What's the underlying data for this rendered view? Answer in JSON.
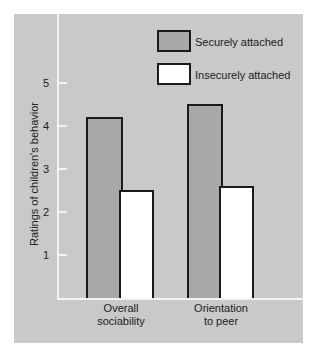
{
  "chart_data": {
    "type": "bar",
    "title": "",
    "xlabel": "",
    "ylabel": "Ratings of children's behavior",
    "ylim": [
      0,
      5.5
    ],
    "yticks": [
      1,
      2,
      3,
      4,
      5
    ],
    "grid": false,
    "legend_position": "top-right",
    "categories": [
      "Overall sociability",
      "Orientation to peer"
    ],
    "category_lines": [
      [
        "Overall",
        "sociability"
      ],
      [
        "Orientation",
        "to peer"
      ]
    ],
    "series": [
      {
        "name": "Securely attached",
        "values": [
          4.2,
          4.5
        ],
        "color": "#a8a8a8"
      },
      {
        "name": "Insecurely attached",
        "values": [
          2.5,
          2.6
        ],
        "color": "#ffffff"
      }
    ]
  },
  "tick_labels": [
    "1",
    "2",
    "3",
    "4",
    "5"
  ],
  "legend": {
    "secure": "Securely attached",
    "insecure": "Insecurely attached"
  }
}
